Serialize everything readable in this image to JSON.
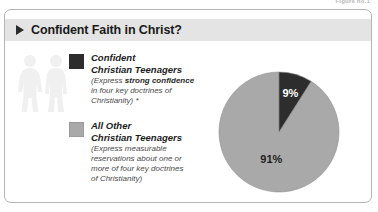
{
  "figure_caption": "Figure no.1",
  "panel": {
    "header": {
      "arrow_icon": "triangle-right-icon",
      "title": "Confident Faith in Christ?"
    },
    "watermark_icon": "two-people-silhouette-icon"
  },
  "legend": {
    "entries": [
      {
        "swatch_icon": "legend-swatch-dark",
        "color": "#2d2d2d",
        "title_line1": "Confident",
        "title_line2": "Christian Teenagers",
        "sub_prefix": "(Express ",
        "sub_bold": "strong confidence",
        "sub_line2": "in four key doctrines of",
        "sub_line3": "Christianity) *"
      },
      {
        "swatch_icon": "legend-swatch-light",
        "color": "#a9a9a9",
        "title_line1": "All Other",
        "title_line2": "Christian Teenagers",
        "sub_line1": "(Express measurable",
        "sub_line2": "reservations about one or",
        "sub_line3": "more of four key doctrines",
        "sub_line4": "of Christianity)"
      }
    ]
  },
  "chart_data": {
    "type": "pie",
    "title": "Confident Faith in Christ?",
    "categories": [
      "Confident Christian Teenagers",
      "All Other Christian Teenagers"
    ],
    "values": [
      9,
      91
    ],
    "labels": [
      "9%",
      "91%"
    ],
    "colors": [
      "#2d2d2d",
      "#a9a9a9"
    ],
    "units": "percent",
    "start_angle_deg": 0,
    "direction": "clockwise",
    "legend_position": "left",
    "grid": false
  }
}
